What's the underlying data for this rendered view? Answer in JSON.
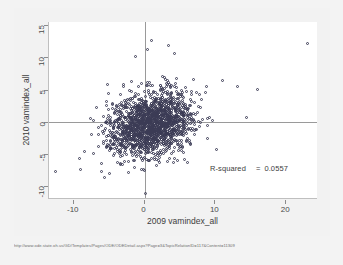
{
  "figure": {
    "background_color": "#f2f2f2",
    "plot_background_color": "#ffffff",
    "marker_color": "#3b3b55",
    "reference_line_color": "#9a9a9a",
    "axis_color": "#bfbfbf"
  },
  "annotation": {
    "rsquared_label": "R-squared",
    "equals": "=",
    "rsquared_value": "0.0557"
  },
  "footer": {
    "url": "http://www.ode.state.oh.us/GD/Templates/Pages/ODE/ODEDetail.aspx?Page=3&TopicRelationID=117&Content=11309"
  },
  "chart_data": {
    "type": "scatter",
    "title": "",
    "xlabel": "2009 vamindex_all",
    "ylabel": "2010 vamindex_all",
    "xlim": [
      -13.5,
      24.5
    ],
    "ylim": [
      -12.0,
      15.5
    ],
    "xticks": [
      -10,
      0,
      10,
      20
    ],
    "yticks": [
      -10,
      -5,
      0,
      5,
      10,
      15
    ],
    "xtick_labels": [
      "-10",
      "0",
      "10",
      "20"
    ],
    "ytick_labels": [
      "-10",
      "-5",
      "0",
      "5",
      "10",
      "15"
    ],
    "grid": false,
    "legend": null,
    "reference_lines": {
      "vertical_x": 0,
      "horizontal_y": 0
    },
    "marker": "open-circle",
    "n_points": 1800,
    "statistics": {
      "r_squared": 0.0557,
      "x_mean": 1.0,
      "y_mean": -0.35,
      "x_sd": 3.0,
      "y_sd": 2.5,
      "correlation": 0.236
    },
    "notable_points": [
      {
        "x": 23.0,
        "y": 12.1
      },
      {
        "x": -12.6,
        "y": -7.7
      },
      {
        "x": 3.4,
        "y": 11.9
      },
      {
        "x": 1.0,
        "y": 12.6
      },
      {
        "x": 0.4,
        "y": 11.3
      },
      {
        "x": -1.3,
        "y": 10.2
      },
      {
        "x": 16.0,
        "y": 5.0
      },
      {
        "x": 13.1,
        "y": 5.5
      },
      {
        "x": 14.4,
        "y": 0.6
      },
      {
        "x": 0.1,
        "y": -11.2
      },
      {
        "x": -5.6,
        "y": -8.6
      },
      {
        "x": -9.1,
        "y": -7.4
      }
    ]
  }
}
